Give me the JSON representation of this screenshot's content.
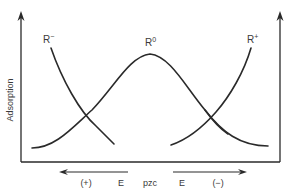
{
  "diagram": {
    "type": "adsorption-vs-potential",
    "y_axis_label": "Adsorption",
    "curves": [
      {
        "id": "r_minus",
        "label_base": "R",
        "label_sup": "−",
        "shape": "decreasing toward pzc"
      },
      {
        "id": "r_zero",
        "label_base": "R",
        "label_sup": "0",
        "shape": "bell, max at pzc"
      },
      {
        "id": "r_plus",
        "label_base": "R",
        "label_sup": "+",
        "shape": "increasing away from pzc"
      }
    ],
    "x_axis": {
      "center_label": "pzc",
      "left": {
        "sign": "(+)",
        "letter": "E",
        "direction": "left"
      },
      "right": {
        "letter": "E",
        "sign": "(−)",
        "direction": "right"
      }
    },
    "colors": {
      "line": "#2a2a2a",
      "text": "#3a3a3a",
      "background": "#ffffff"
    }
  }
}
